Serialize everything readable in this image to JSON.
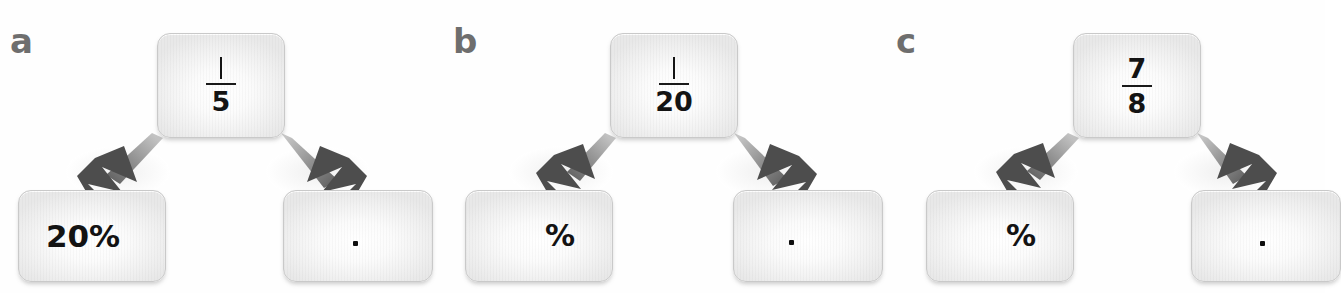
{
  "figure": {
    "kind": "fraction-to-percent-and-decimal-diagram",
    "background_color": "#fefefe",
    "card_border_color": "#c9c9c9",
    "arrow_color": "#4d4d4d",
    "label_color": "#6e6e6e",
    "text_color": "#131313"
  },
  "panels": [
    {
      "label": "a",
      "source": {
        "name": "fraction-card",
        "numerator": "1",
        "denominator": "5",
        "display": "1/5"
      },
      "targets": [
        {
          "name": "percent-card",
          "text": "20%",
          "kind": "percent",
          "filled": true
        },
        {
          "name": "decimal-card",
          "text": ".",
          "kind": "decimal",
          "filled": false
        }
      ]
    },
    {
      "label": "b",
      "source": {
        "name": "fraction-card",
        "numerator": "1",
        "denominator": "20",
        "display": "1/20"
      },
      "targets": [
        {
          "name": "percent-card",
          "text": "%",
          "kind": "percent",
          "filled": false
        },
        {
          "name": "decimal-card",
          "text": ".",
          "kind": "decimal",
          "filled": false
        }
      ]
    },
    {
      "label": "c",
      "source": {
        "name": "fraction-card",
        "numerator": "7",
        "denominator": "8",
        "display": "7/8"
      },
      "targets": [
        {
          "name": "percent-card",
          "text": "%",
          "kind": "percent",
          "filled": false
        },
        {
          "name": "decimal-card",
          "text": ".",
          "kind": "decimal",
          "filled": false
        }
      ]
    }
  ]
}
